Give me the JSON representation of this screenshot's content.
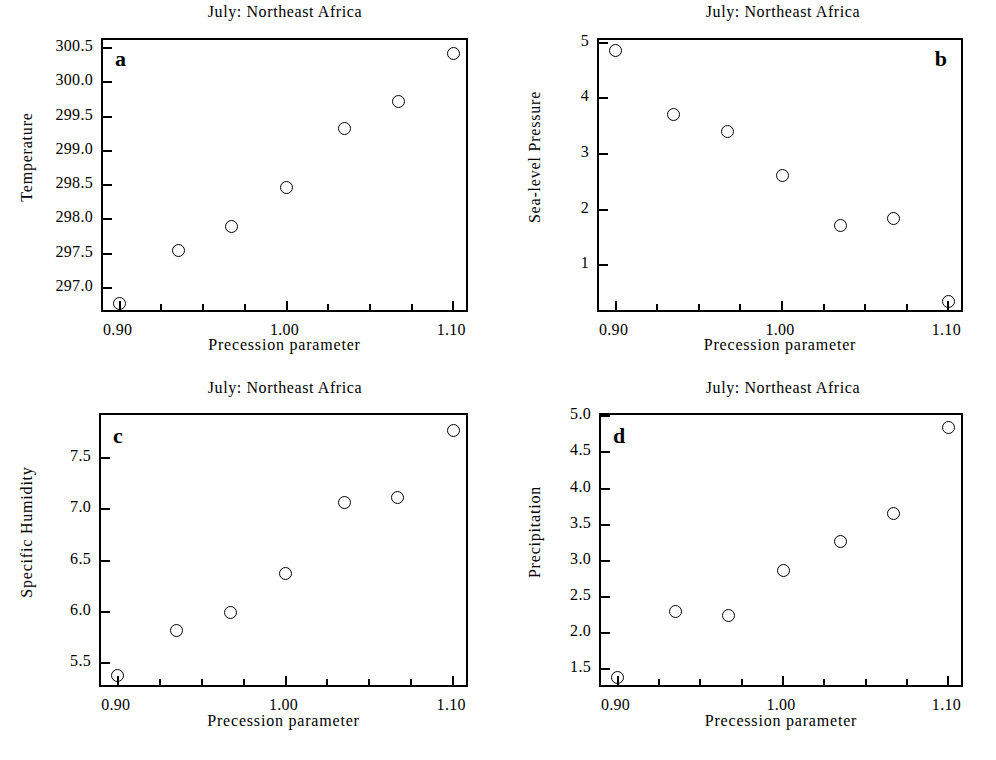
{
  "figure": {
    "background": "#ffffff",
    "ink": "#000000",
    "marker_style": "open-circle"
  },
  "common": {
    "title": "July: Northeast Africa",
    "xlabel": "Precession parameter",
    "x_tick_labels": [
      "0.90",
      "1.00",
      "1.10"
    ],
    "x_tick_values": [
      0.9,
      1.0,
      1.1
    ],
    "x_minor_ticks": [
      0.925,
      0.95,
      0.975,
      1.025,
      1.05,
      1.075
    ],
    "xlim": [
      0.89,
      1.11
    ]
  },
  "panels": [
    {
      "letter": "a",
      "letter_position": "top-left",
      "title": "July: Northeast Africa",
      "ylabel": "Temperature",
      "xlabel": "Precession parameter",
      "y_tick_labels": [
        "297.0",
        "297.5",
        "298.0",
        "298.5",
        "299.0",
        "299.5",
        "300.0",
        "300.5"
      ],
      "y_tick_values": [
        297.0,
        297.5,
        298.0,
        298.5,
        299.0,
        299.5,
        300.0,
        300.5
      ],
      "ylim": [
        296.62,
        300.62
      ],
      "x_tick_labels": [
        "0.90",
        "1.00",
        "1.10"
      ]
    },
    {
      "letter": "b",
      "letter_position": "top-right",
      "title": "July: Northeast Africa",
      "ylabel": "Sea-level Pressure",
      "xlabel": "Precession parameter",
      "y_tick_labels": [
        "1",
        "2",
        "3",
        "4",
        "5"
      ],
      "y_tick_values": [
        1,
        2,
        3,
        4,
        5
      ],
      "ylim": [
        0.12,
        5.05
      ],
      "x_tick_labels": [
        "0.90",
        "1.00",
        "1.10"
      ]
    },
    {
      "letter": "c",
      "letter_position": "top-left",
      "title": "July: Northeast Africa",
      "ylabel": "Specific Humidity",
      "xlabel": "Precession parameter",
      "y_tick_labels": [
        "5.5",
        "6.0",
        "6.5",
        "7.0",
        "7.5"
      ],
      "y_tick_values": [
        5.5,
        6.0,
        6.5,
        7.0,
        7.5
      ],
      "ylim": [
        5.25,
        7.92
      ],
      "x_tick_labels": [
        "0.90",
        "1.00",
        "1.10"
      ]
    },
    {
      "letter": "d",
      "letter_position": "top-left",
      "title": "July: Northeast Africa",
      "ylabel": "Precipitation",
      "xlabel": "Precession parameter",
      "y_tick_labels": [
        "1.5",
        "2.0",
        "2.5",
        "3.0",
        "3.5",
        "4.0",
        "4.5",
        "5.0"
      ],
      "y_tick_values": [
        1.5,
        2.0,
        2.5,
        3.0,
        3.5,
        4.0,
        4.5,
        5.0
      ],
      "ylim": [
        1.22,
        5.02
      ],
      "x_tick_labels": [
        "0.90",
        "1.00",
        "1.10"
      ]
    }
  ],
  "chart_data": [
    {
      "type": "scatter",
      "panel": "a",
      "title": "July: Northeast Africa",
      "xlabel": "Precession parameter",
      "ylabel": "Temperature",
      "x": [
        0.9,
        0.935,
        0.967,
        1.0,
        1.035,
        1.067,
        1.1
      ],
      "y": [
        296.78,
        297.54,
        297.9,
        298.47,
        299.33,
        299.72,
        300.42
      ],
      "xlim": [
        0.89,
        1.11
      ],
      "ylim": [
        296.62,
        300.62
      ],
      "grid": false,
      "legend": false
    },
    {
      "type": "scatter",
      "panel": "b",
      "title": "July: Northeast Africa",
      "xlabel": "Precession parameter",
      "ylabel": "Sea-level Pressure",
      "x": [
        0.9,
        0.935,
        0.967,
        1.0,
        1.035,
        1.067,
        1.1
      ],
      "y": [
        4.87,
        3.71,
        3.4,
        2.62,
        1.71,
        1.84,
        0.34
      ],
      "xlim": [
        0.89,
        1.11
      ],
      "ylim": [
        0.12,
        5.05
      ],
      "grid": false,
      "legend": false
    },
    {
      "type": "scatter",
      "panel": "c",
      "title": "July: Northeast Africa",
      "xlabel": "Precession parameter",
      "ylabel": "Specific Humidity",
      "x": [
        0.9,
        0.935,
        0.967,
        1.0,
        1.035,
        1.067,
        1.1
      ],
      "y": [
        5.38,
        5.82,
        6.0,
        6.38,
        7.07,
        7.12,
        7.77
      ],
      "xlim": [
        0.89,
        1.11
      ],
      "ylim": [
        5.25,
        7.92
      ],
      "grid": false,
      "legend": false
    },
    {
      "type": "scatter",
      "panel": "d",
      "title": "July: Northeast Africa",
      "xlabel": "Precession parameter",
      "ylabel": "Precipitation",
      "x": [
        0.9,
        0.935,
        0.967,
        1.0,
        1.035,
        1.067,
        1.1
      ],
      "y": [
        1.38,
        2.29,
        2.24,
        2.86,
        3.26,
        3.65,
        4.84
      ],
      "xlim": [
        0.89,
        1.11
      ],
      "ylim": [
        1.22,
        5.02
      ],
      "grid": false,
      "legend": false
    }
  ]
}
